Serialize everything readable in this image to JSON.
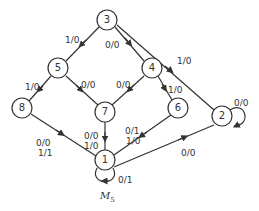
{
  "diagram": {
    "machine_name": "M",
    "machine_subscript": "5",
    "colors": {
      "stroke": "#333333",
      "background": "#ffffff"
    },
    "nodes": [
      {
        "id": "3",
        "x": 107,
        "y": 20
      },
      {
        "id": "5",
        "x": 58,
        "y": 68
      },
      {
        "id": "4",
        "x": 152,
        "y": 68
      },
      {
        "id": "8",
        "x": 22,
        "y": 108
      },
      {
        "id": "7",
        "x": 105,
        "y": 112
      },
      {
        "id": "6",
        "x": 178,
        "y": 108
      },
      {
        "id": "2",
        "x": 222,
        "y": 116
      },
      {
        "id": "1",
        "x": 105,
        "y": 160
      }
    ],
    "edges": [
      {
        "from": "3",
        "to": "5",
        "label": "1/0"
      },
      {
        "from": "3",
        "to": "4",
        "label": "0/0"
      },
      {
        "from": "3",
        "to": "2",
        "label": "1/0"
      },
      {
        "from": "5",
        "to": "8",
        "label": "1/0"
      },
      {
        "from": "5",
        "to": "7",
        "label": "0/0"
      },
      {
        "from": "4",
        "to": "7",
        "label": "0/0"
      },
      {
        "from": "4",
        "to": "6",
        "label": "1/0"
      },
      {
        "from": "8",
        "to": "1",
        "label": "0/0\n1/1",
        "label_lines": [
          "0/0",
          "1/1"
        ]
      },
      {
        "from": "7",
        "to": "1",
        "label_lines": [
          "0/0",
          "1/0"
        ]
      },
      {
        "from": "6",
        "to": "1",
        "label_lines": [
          "0/1",
          "1/0"
        ]
      },
      {
        "from": "1",
        "to": "2",
        "label": "0/0"
      },
      {
        "from": "2",
        "to": "2",
        "label": "0/0"
      },
      {
        "from": "1",
        "to": "1",
        "label": "0/1"
      }
    ]
  },
  "labels": {
    "e35": "1/0",
    "e34": "0/0",
    "e32": "1/0",
    "e58": "1/0",
    "e57": "0/0",
    "e47": "0/0",
    "e46": "1/0",
    "e81_a": "0/0",
    "e81_b": "1/1",
    "e71_a": "0/0",
    "e71_b": "1/0",
    "e61_a": "0/1",
    "e61_b": "1/0",
    "e12": "0/0",
    "e22": "0/0",
    "e11": "0/1"
  },
  "node_labels": {
    "n1": "1",
    "n2": "2",
    "n3": "3",
    "n4": "4",
    "n5": "5",
    "n6": "6",
    "n7": "7",
    "n8": "8"
  }
}
